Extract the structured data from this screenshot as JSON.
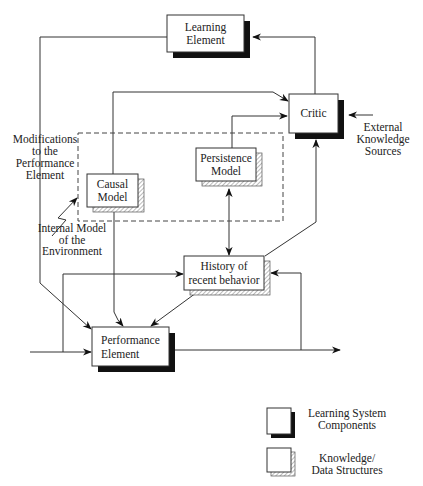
{
  "diagram": {
    "nodes": {
      "learning_element": {
        "line1": "Learning",
        "line2": "Element",
        "kind": "component"
      },
      "critic": {
        "line1": "Critic",
        "kind": "component"
      },
      "persistence_model": {
        "line1": "Persistence",
        "line2": "Model",
        "kind": "knowledge"
      },
      "causal_model": {
        "line1": "Causal",
        "line2": "Model",
        "kind": "knowledge"
      },
      "history": {
        "line1": "History of",
        "line2": "recent behavior",
        "kind": "knowledge"
      },
      "performance_element": {
        "line1": "Performance",
        "line2": "Element",
        "kind": "component"
      }
    },
    "labels": {
      "modifications": [
        "Modifications",
        "to the",
        "Performance",
        "Element"
      ],
      "internal_model": [
        "Internal Model",
        "of the",
        "Environment"
      ],
      "external_knowledge": [
        "External",
        "Knowledge",
        "Sources"
      ]
    },
    "legend": {
      "component": [
        "Learning System",
        "Components"
      ],
      "knowledge": [
        "Knowledge/",
        "Data Structures"
      ]
    },
    "edges": [
      {
        "from": "critic",
        "to": "learning_element"
      },
      {
        "from": "learning_element",
        "to": "performance_element",
        "label": "Modifications to the Performance Element"
      },
      {
        "from": "causal_model",
        "to": "critic"
      },
      {
        "from": "persistence_model",
        "to": "critic"
      },
      {
        "from": "external_knowledge_sources",
        "to": "critic"
      },
      {
        "from": "persistence_model",
        "to": "history",
        "bidirectional": true
      },
      {
        "from": "history",
        "to": "critic"
      },
      {
        "from": "history",
        "to": "performance_element"
      },
      {
        "from": "causal_model",
        "to": "performance_element"
      },
      {
        "from": "input",
        "to": "performance_element"
      },
      {
        "from": "input",
        "to": "history"
      },
      {
        "from": "performance_element",
        "to": "output"
      },
      {
        "from": "output",
        "to": "history"
      }
    ],
    "colors": {
      "line": "#333333",
      "shadow": "#111111",
      "background": "#ffffff"
    }
  }
}
